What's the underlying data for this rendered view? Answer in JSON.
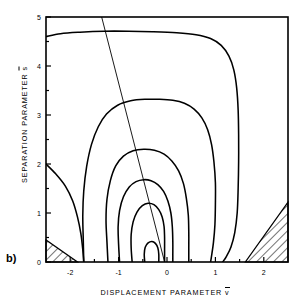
{
  "figure": {
    "panel_label": "b)",
    "xlabel_prefix": "DISPLACEMENT PARAMETER ",
    "xlabel_symbol": "v",
    "ylabel_prefix": "SEPARATION PARAMETER ",
    "ylabel_symbol": "s",
    "line_color": "#000000",
    "background": "#ffffff"
  },
  "chart_data": {
    "type": "line",
    "title": "",
    "subtitle": "",
    "xlabel": "DISPLACEMENT PARAMETER v̄",
    "ylabel": "SEPARATION PARAMETER s̄",
    "xlim": [
      -2.5,
      2.5
    ],
    "ylim": [
      0,
      5
    ],
    "xticks": [
      -2,
      -1,
      0,
      1,
      2
    ],
    "xticklabels": [
      "-2",
      "-1",
      "0",
      "1",
      "2"
    ],
    "xminorticks": [
      -2.5,
      -1.5,
      -0.5,
      0.5,
      1.5,
      2.5
    ],
    "yticks": [
      0,
      1,
      2,
      3,
      4,
      5
    ],
    "yticklabels": [
      "0",
      "1",
      "2",
      "3",
      "4",
      "5"
    ],
    "yminorticks": [
      0.5,
      1.5,
      2.5,
      3.5,
      4.5
    ],
    "grid": false,
    "legend": null,
    "plot_kind": "contour",
    "contours": [
      {
        "name": "contour-1-outermost",
        "level_index": 1,
        "points": [
          [
            -2.5,
            4.6
          ],
          [
            -2.2,
            4.66
          ],
          [
            -1.8,
            4.69
          ],
          [
            -1.3,
            4.71
          ],
          [
            -0.8,
            4.71
          ],
          [
            -0.3,
            4.7
          ],
          [
            0.2,
            4.68
          ],
          [
            0.6,
            4.64
          ],
          [
            0.9,
            4.56
          ],
          [
            1.12,
            4.42
          ],
          [
            1.28,
            4.2
          ],
          [
            1.38,
            3.92
          ],
          [
            1.44,
            3.55
          ],
          [
            1.47,
            3.1
          ],
          [
            1.48,
            2.6
          ],
          [
            1.48,
            2.05
          ],
          [
            1.47,
            1.5
          ],
          [
            1.45,
            1.0
          ],
          [
            1.4,
            0.6
          ],
          [
            1.32,
            0.3
          ],
          [
            1.22,
            0.1
          ],
          [
            1.15,
            0.0
          ]
        ]
      },
      {
        "name": "contour-2",
        "level_index": 2,
        "points": [
          [
            -2.5,
            2.0
          ],
          [
            -2.3,
            1.8
          ],
          [
            -2.1,
            1.55
          ],
          [
            -1.95,
            1.25
          ],
          [
            -1.85,
            0.92
          ],
          [
            -1.78,
            0.58
          ],
          [
            -1.74,
            0.25
          ],
          [
            -1.72,
            0.0
          ]
        ],
        "note": "left branch running from left edge down to the bottom axis"
      },
      {
        "name": "contour-3",
        "level_index": 3,
        "points": [
          [
            -1.72,
            0.0
          ],
          [
            -1.73,
            0.45
          ],
          [
            -1.74,
            0.95
          ],
          [
            -1.72,
            1.45
          ],
          [
            -1.66,
            1.95
          ],
          [
            -1.56,
            2.4
          ],
          [
            -1.42,
            2.76
          ],
          [
            -1.25,
            3.02
          ],
          [
            -1.02,
            3.2
          ],
          [
            -0.75,
            3.29
          ],
          [
            -0.45,
            3.32
          ],
          [
            -0.15,
            3.32
          ],
          [
            0.12,
            3.3
          ],
          [
            0.36,
            3.24
          ],
          [
            0.56,
            3.12
          ],
          [
            0.72,
            2.94
          ],
          [
            0.84,
            2.7
          ],
          [
            0.92,
            2.4
          ],
          [
            0.97,
            2.04
          ],
          [
            1.0,
            1.62
          ],
          [
            1.0,
            1.18
          ],
          [
            0.99,
            0.76
          ],
          [
            0.96,
            0.4
          ],
          [
            0.92,
            0.12
          ],
          [
            0.9,
            0.0
          ]
        ],
        "note": "large closed lobe, open at the bottom axis"
      },
      {
        "name": "contour-4",
        "level_index": 4,
        "points": [
          [
            -1.22,
            0.0
          ],
          [
            -1.24,
            0.4
          ],
          [
            -1.26,
            0.85
          ],
          [
            -1.24,
            1.28
          ],
          [
            -1.17,
            1.66
          ],
          [
            -1.06,
            1.96
          ],
          [
            -0.9,
            2.16
          ],
          [
            -0.7,
            2.27
          ],
          [
            -0.48,
            2.3
          ],
          [
            -0.26,
            2.28
          ],
          [
            -0.06,
            2.2
          ],
          [
            0.1,
            2.06
          ],
          [
            0.24,
            1.86
          ],
          [
            0.34,
            1.6
          ],
          [
            0.4,
            1.3
          ],
          [
            0.44,
            0.96
          ],
          [
            0.45,
            0.6
          ],
          [
            0.45,
            0.28
          ],
          [
            0.45,
            0.0
          ]
        ]
      },
      {
        "name": "contour-5",
        "level_index": 5,
        "points": [
          [
            -0.98,
            0.0
          ],
          [
            -1.0,
            0.36
          ],
          [
            -1.01,
            0.72
          ],
          [
            -0.98,
            1.05
          ],
          [
            -0.9,
            1.33
          ],
          [
            -0.78,
            1.53
          ],
          [
            -0.64,
            1.64
          ],
          [
            -0.48,
            1.68
          ],
          [
            -0.33,
            1.66
          ],
          [
            -0.19,
            1.58
          ],
          [
            -0.07,
            1.44
          ],
          [
            0.02,
            1.24
          ],
          [
            0.08,
            1.0
          ],
          [
            0.11,
            0.72
          ],
          [
            0.12,
            0.42
          ],
          [
            0.12,
            0.15
          ],
          [
            0.12,
            0.0
          ]
        ]
      },
      {
        "name": "contour-6",
        "level_index": 6,
        "points": [
          [
            -0.72,
            0.0
          ],
          [
            -0.74,
            0.28
          ],
          [
            -0.74,
            0.56
          ],
          [
            -0.7,
            0.82
          ],
          [
            -0.62,
            1.02
          ],
          [
            -0.51,
            1.15
          ],
          [
            -0.39,
            1.2
          ],
          [
            -0.27,
            1.17
          ],
          [
            -0.17,
            1.07
          ],
          [
            -0.1,
            0.92
          ],
          [
            -0.06,
            0.72
          ],
          [
            -0.05,
            0.5
          ],
          [
            -0.05,
            0.25
          ],
          [
            -0.05,
            0.0
          ]
        ]
      },
      {
        "name": "contour-7-innermost",
        "level_index": 7,
        "points": [
          [
            -0.46,
            0.0
          ],
          [
            -0.47,
            0.16
          ],
          [
            -0.45,
            0.3
          ],
          [
            -0.39,
            0.39
          ],
          [
            -0.31,
            0.42
          ],
          [
            -0.24,
            0.38
          ],
          [
            -0.19,
            0.29
          ],
          [
            -0.17,
            0.16
          ],
          [
            -0.17,
            0.0
          ]
        ]
      }
    ],
    "reaction_line": {
      "name": "reaction-path-line",
      "start": [
        -1.35,
        5.0
      ],
      "end": [
        -0.05,
        0.0
      ],
      "style": "thin solid"
    },
    "hatched_regions": [
      {
        "name": "hatch-bottom-left",
        "vertices": [
          [
            -2.5,
            0.45
          ],
          [
            -2.5,
            0.0
          ],
          [
            -1.85,
            0.0
          ]
        ],
        "hatch_angle_deg": 45
      },
      {
        "name": "hatch-bottom-right",
        "vertices": [
          [
            2.5,
            1.22
          ],
          [
            2.5,
            0.0
          ],
          [
            1.62,
            0.0
          ]
        ],
        "hatch_angle_deg": 45
      }
    ]
  }
}
